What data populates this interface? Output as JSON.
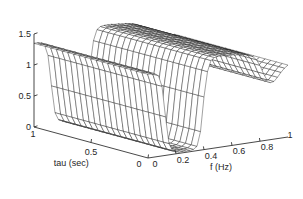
{
  "figure": {
    "kind": "matlab-mesh-surface-plot",
    "background_color": "#ffffff",
    "line_color": "#1c1c1c",
    "axis_color": "#1a1a1a"
  },
  "axes": {
    "x": {
      "name": "tau-axis",
      "label": "tau (sec)",
      "ticks": [
        "1",
        "0.5",
        "0"
      ],
      "tick_values": [
        1,
        0.5,
        0
      ],
      "range": [
        1,
        0
      ],
      "direction": "decreasing-left-to-right"
    },
    "y": {
      "name": "f-axis",
      "label": "f (Hz)",
      "ticks": [
        "0",
        "0.2",
        "0.4",
        "0.6",
        "0.8",
        "1"
      ],
      "tick_values": [
        0,
        0.2,
        0.4,
        0.6,
        0.8,
        1
      ],
      "range": [
        0,
        1
      ],
      "direction": "increasing-left-to-right"
    },
    "z": {
      "name": "z-axis",
      "label": "",
      "ticks": [
        "0",
        "0.5",
        "1",
        "1.5"
      ],
      "tick_values": [
        0,
        0.5,
        1,
        1.5
      ],
      "range": [
        0,
        1.5
      ]
    }
  },
  "chart_data": {
    "type": "surface",
    "title": "",
    "xlabel": "tau (sec)",
    "ylabel": "f (Hz)",
    "zlabel": "",
    "xlim": [
      0,
      1
    ],
    "ylim": [
      0,
      1
    ],
    "zlim": [
      0,
      1.5
    ],
    "grid": false,
    "legend": "none",
    "x_name": "tau",
    "y_name": "f",
    "x_ticks": [
      1,
      0.5,
      0
    ],
    "y_ticks": [
      0,
      0.2,
      0.4,
      0.6,
      0.8,
      1
    ],
    "z_ticks": [
      0,
      0.5,
      1,
      1.5
    ],
    "mesh_nx": 21,
    "mesh_ny": 41,
    "profile_description": "Surface is nearly independent of tau; a ridge-and-plateau profile in f: high plateau ~1.35 near f=0, steep drop to a flat valley floor ~0.02 for f in 0.08-0.33, steep rise to a tall flat ridge ~1.45 for f in 0.40-0.72, then drop to ~0.9 shoulder near f=0.85 and ~1.15 at f=1.",
    "f_samples": [
      0.0,
      0.025,
      0.05,
      0.075,
      0.1,
      0.125,
      0.15,
      0.175,
      0.2,
      0.225,
      0.25,
      0.275,
      0.3,
      0.325,
      0.35,
      0.375,
      0.4,
      0.425,
      0.45,
      0.475,
      0.5,
      0.525,
      0.55,
      0.575,
      0.6,
      0.625,
      0.65,
      0.675,
      0.7,
      0.725,
      0.75,
      0.775,
      0.8,
      0.825,
      0.85,
      0.875,
      0.9,
      0.925,
      0.95,
      0.975,
      1.0
    ],
    "z_profile": [
      1.35,
      1.35,
      1.34,
      1.3,
      1.12,
      0.62,
      0.18,
      0.06,
      0.03,
      0.02,
      0.02,
      0.02,
      0.02,
      0.03,
      0.07,
      0.3,
      0.85,
      1.25,
      1.42,
      1.46,
      1.47,
      1.47,
      1.47,
      1.46,
      1.46,
      1.45,
      1.45,
      1.44,
      1.43,
      1.41,
      1.38,
      1.32,
      1.22,
      1.08,
      0.97,
      0.92,
      0.93,
      0.99,
      1.06,
      1.12,
      1.16
    ],
    "tau_samples": [
      0.0,
      0.05,
      0.1,
      0.15,
      0.2,
      0.25,
      0.3,
      0.35,
      0.4,
      0.45,
      0.5,
      0.55,
      0.6,
      0.65,
      0.7,
      0.75,
      0.8,
      0.85,
      0.9,
      0.95,
      1.0
    ],
    "tau_modulation": [
      1.0,
      1.0,
      1.0,
      1.0,
      1.0,
      1.0,
      1.0,
      1.0,
      1.0,
      1.0,
      1.0,
      1.0,
      1.0,
      1.0,
      1.0,
      1.0,
      1.0,
      1.0,
      1.0,
      1.0,
      1.0
    ]
  },
  "projection": {
    "origin_x": 148,
    "origin_y": 158,
    "tau_axis_end_x": 34,
    "tau_axis_end_y": 127,
    "f_axis_end_x": 288,
    "f_axis_end_y": 137,
    "z_axis_top_x": 34,
    "z_axis_top_y": 34,
    "z_axis_bottom_x": 34,
    "z_axis_bottom_y": 127
  }
}
